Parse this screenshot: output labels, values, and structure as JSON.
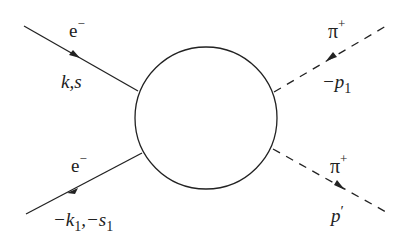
{
  "diagram": {
    "type": "feynman-diagram",
    "blob": {
      "cx": 206,
      "cy": 118,
      "r": 72
    },
    "lines": [
      {
        "id": "incoming-electron",
        "style": "solid",
        "particle": "e",
        "particle_sup": "−",
        "momentum": "k,s"
      },
      {
        "id": "outgoing-electron",
        "style": "solid",
        "particle": "e",
        "particle_sup": "−",
        "momentum": "−k",
        "momentum_sub": "1",
        "momentum2": ",−s",
        "momentum2_sub": "1"
      },
      {
        "id": "pion-top",
        "style": "dashed",
        "particle": "π",
        "particle_sup": "+",
        "momentum": "−p",
        "momentum_sub": "1"
      },
      {
        "id": "pion-bottom",
        "style": "dashed",
        "particle": "π",
        "particle_sup": "+",
        "momentum": "p",
        "momentum_sup": "′"
      }
    ],
    "colors": {
      "ink": "#222222",
      "background": "#ffffff"
    }
  }
}
